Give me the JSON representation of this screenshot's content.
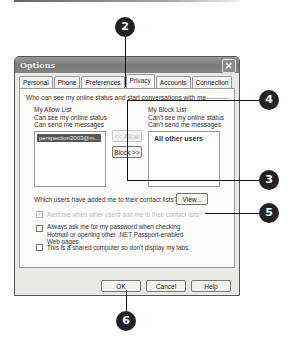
{
  "dialog": {
    "title": "Options",
    "close_icon": "close-icon",
    "tabs": [
      {
        "label": "Personal",
        "active": false
      },
      {
        "label": "Phone",
        "active": false
      },
      {
        "label": "Preferences",
        "active": false
      },
      {
        "label": "Privacy",
        "active": true
      },
      {
        "label": "Accounts",
        "active": false
      },
      {
        "label": "Connection",
        "active": false
      }
    ],
    "privacy": {
      "group_title": "Who can see my online status and start conversations with me",
      "allow_list": {
        "title": "My Allow List",
        "desc1": "Can see my online status",
        "desc2": "Can send me messages",
        "items": [
          "perspection2003@m..."
        ]
      },
      "block_list": {
        "title": "My Block List",
        "desc1": "Can't see my online status",
        "desc2": "Can't send me messages",
        "items": [
          "All other users"
        ]
      },
      "allow_button": "<< Allow",
      "block_button": "Block >>",
      "contact_question": "Which users have added me to their contact lists?",
      "view_button": "View...",
      "alert_checkbox": {
        "label": "Alert me when other users add me to their contact lists",
        "checked": true,
        "disabled": true
      },
      "password_checkbox": {
        "label": "Always ask me for my password when checking Hotmail or opening other .NET Passport-enabled Web pages",
        "checked": false
      },
      "shared_checkbox": {
        "label": "This is a shared computer so don't display my tabs.",
        "checked": false
      }
    },
    "buttons": {
      "ok": "OK",
      "cancel": "Cancel",
      "help": "Help"
    }
  },
  "callouts": {
    "c2": "2",
    "c3": "3",
    "c4": "4",
    "c5": "5",
    "c6": "6"
  }
}
